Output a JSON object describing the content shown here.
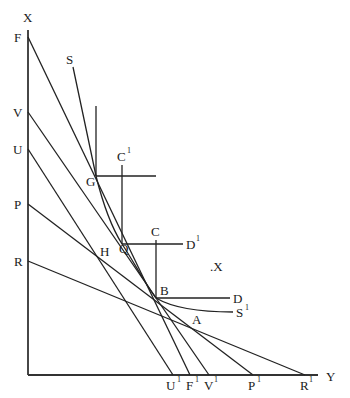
{
  "diagram": {
    "axes": {
      "vertical_label": "X",
      "horizontal_label": "Y",
      "origin": [
        28,
        375
      ],
      "vertical_top": [
        28,
        30
      ],
      "horizontal_end": [
        318,
        375
      ]
    },
    "axis_points_vertical": [
      {
        "label": "F",
        "y": 37
      },
      {
        "label": "V",
        "y": 112
      },
      {
        "label": "U",
        "y": 149
      },
      {
        "label": "P",
        "y": 204
      },
      {
        "label": "R",
        "y": 261
      }
    ],
    "axis_points_horizontal": [
      {
        "label": "U",
        "sup": "1",
        "x": 173
      },
      {
        "label": "F",
        "sup": "1",
        "x": 190
      },
      {
        "label": "V",
        "sup": "1",
        "x": 209
      },
      {
        "label": "P",
        "sup": "1",
        "x": 253
      },
      {
        "label": "R",
        "sup": "1",
        "x": 305
      }
    ],
    "lines": [
      {
        "name": "FF1",
        "from": "F",
        "to": "F1"
      },
      {
        "name": "VV1",
        "from": "V",
        "to": "V1"
      },
      {
        "name": "UU1",
        "from": "U",
        "to": "U1"
      },
      {
        "name": "PP1",
        "from": "P",
        "to": "P1"
      },
      {
        "name": "RR1",
        "from": "R",
        "to": "R1"
      }
    ],
    "points": {
      "G": "G",
      "Q": "Q",
      "B": "B",
      "H": "H",
      "A": "A",
      "X_point": ".X"
    },
    "labels": {
      "S": "S",
      "S1": "S",
      "S1_sup": "1",
      "C": "C",
      "C1": "C",
      "C1_sup": "1",
      "D": "D",
      "D1": "D",
      "D1_sup": "1",
      "X_top": "X",
      "Y_right": "Y",
      "F": "F",
      "V": "V",
      "U": "U",
      "P": "P",
      "R": "R",
      "G": "G",
      "Q": "Q",
      "B": "B",
      "H": "H",
      "A": "A",
      "X_mid": ".X",
      "U1": "U",
      "F1": "F",
      "V1": "V",
      "P1": "P",
      "R1": "R",
      "sup1": "1"
    },
    "curve": {
      "name": "SS1",
      "through": [
        "S",
        "G",
        "Q",
        "B",
        "S1"
      ]
    },
    "corner_lines": [
      {
        "at": "G",
        "vertical_top": 106,
        "horizontal_end": 156
      },
      {
        "at": "Q",
        "label_v": "C1",
        "label_h": "D1"
      },
      {
        "at": "B",
        "label_v": "C",
        "label_h": "D"
      }
    ]
  }
}
